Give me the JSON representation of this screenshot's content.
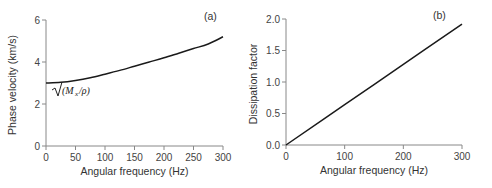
{
  "chart_data": [
    {
      "type": "line",
      "panel_label": "(a)",
      "title": "",
      "xlabel": "Angular frequency (Hz)",
      "ylabel": "Phase velocity (km/s)",
      "xlim": [
        0,
        300
      ],
      "ylim": [
        0,
        6
      ],
      "xticks": [
        0,
        50,
        100,
        150,
        200,
        250,
        300
      ],
      "yticks": [
        0,
        2,
        4,
        6
      ],
      "grid": false,
      "annotation": "√(Mₓ/ρ)",
      "series": [
        {
          "name": "Phase velocity",
          "x": [
            0,
            25,
            50,
            75,
            100,
            125,
            150,
            175,
            200,
            225,
            250,
            275,
            300
          ],
          "values": [
            3.0,
            3.03,
            3.12,
            3.25,
            3.42,
            3.6,
            3.8,
            4.0,
            4.2,
            4.42,
            4.64,
            4.86,
            5.2
          ]
        }
      ]
    },
    {
      "type": "line",
      "panel_label": "(b)",
      "title": "",
      "xlabel": "Angular frequency (Hz)",
      "ylabel": "Dissipation factor",
      "xlim": [
        0,
        300
      ],
      "ylim": [
        0,
        2.0
      ],
      "xticks": [
        0,
        100,
        200,
        300
      ],
      "yticks": [
        "0.0",
        "0.5",
        "1.0",
        "1.5",
        "2.0"
      ],
      "grid": false,
      "series": [
        {
          "name": "Dissipation factor",
          "x": [
            0,
            100,
            200,
            300
          ],
          "values": [
            0.0,
            0.64,
            1.28,
            1.92
          ]
        }
      ]
    }
  ]
}
